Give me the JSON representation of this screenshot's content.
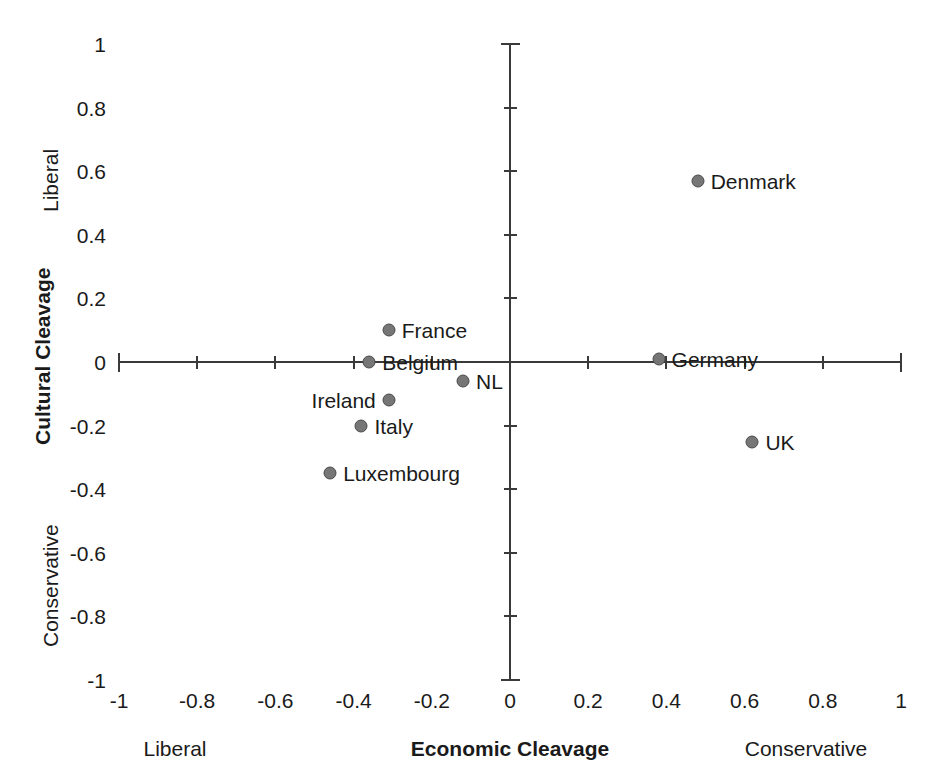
{
  "chart_data": {
    "type": "scatter",
    "title": "",
    "xlabel": "Economic Cleavage",
    "ylabel": "Cultural Cleavage",
    "xlim": [
      -1,
      1
    ],
    "ylim": [
      -1,
      1
    ],
    "grid": false,
    "legend": "none",
    "x_axis_pole_low": "Liberal",
    "x_axis_pole_high": "Conservative",
    "y_axis_pole_high": "Liberal",
    "y_axis_pole_low": "Conservative",
    "xticks": [
      "-1",
      "-0.8",
      "-0.6",
      "-0.4",
      "-0.2",
      "0",
      "0.2",
      "0.4",
      "0.6",
      "0.8",
      "1"
    ],
    "xtick_values": [
      -1,
      -0.8,
      -0.6,
      -0.4,
      -0.2,
      0,
      0.2,
      0.4,
      0.6,
      0.8,
      1
    ],
    "yticks": [
      "1",
      "0.8",
      "0.6",
      "0.4",
      "0.2",
      "0",
      "-0.2",
      "-0.4",
      "-0.6",
      "-0.8",
      "-1"
    ],
    "ytick_values": [
      1,
      0.8,
      0.6,
      0.4,
      0.2,
      0,
      -0.2,
      -0.4,
      -0.6,
      -0.8,
      -1
    ],
    "marker_color": "#767676",
    "marker_edge_color": "#4a4a4a",
    "axis_color": "#3a3a3a",
    "points": [
      {
        "label": "Denmark",
        "x": 0.48,
        "y": 0.57,
        "label_side": "right"
      },
      {
        "label": "France",
        "x": -0.31,
        "y": 0.1,
        "label_side": "right"
      },
      {
        "label": "Belgium",
        "x": -0.36,
        "y": 0.0,
        "label_side": "right"
      },
      {
        "label": "Germany",
        "x": 0.38,
        "y": 0.01,
        "label_side": "right"
      },
      {
        "label": "NL",
        "x": -0.12,
        "y": -0.06,
        "label_side": "right"
      },
      {
        "label": "Ireland",
        "x": -0.31,
        "y": -0.12,
        "label_side": "left"
      },
      {
        "label": "Italy",
        "x": -0.38,
        "y": -0.2,
        "label_side": "right"
      },
      {
        "label": "UK",
        "x": 0.62,
        "y": -0.25,
        "label_side": "right"
      },
      {
        "label": "Luxembourg",
        "x": -0.46,
        "y": -0.35,
        "label_side": "right"
      }
    ]
  },
  "geometry": {
    "origin_x": 510,
    "origin_y": 362,
    "px_per_unit_x": 391,
    "px_per_unit_y": 318
  }
}
